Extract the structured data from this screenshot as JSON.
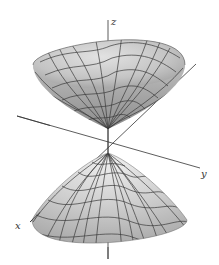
{
  "figure": {
    "axes": {
      "x_label": "x",
      "y_label": "y",
      "z_label": "z"
    },
    "colors": {
      "background": "#ffffff",
      "surface_light": "#dcdcdc",
      "surface_mid": "#c2c2c2",
      "surface_dark": "#8a8a8a",
      "mesh_line": "#3a3a3a",
      "axis_line": "#333333"
    }
  }
}
